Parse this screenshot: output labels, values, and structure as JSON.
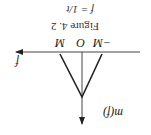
{
  "figure": {
    "caption": "Figure 4. 2",
    "subcaption": "f = 1/t",
    "y_axis_label": "m(f)",
    "x_axis_label": "f",
    "ticks": [
      "−M",
      "O",
      "M"
    ],
    "orientation": "rotated 180°"
  },
  "colors": {
    "line": "#222222",
    "background": "#ffffff"
  }
}
